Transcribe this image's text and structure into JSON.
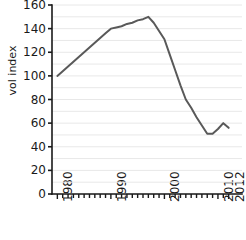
{
  "chart_data": {
    "type": "line",
    "title": "",
    "xlabel": "",
    "ylabel": "vol index",
    "xlim": [
      1979,
      2013
    ],
    "ylim": [
      0,
      160
    ],
    "grid": true,
    "grid_minor_step": 10,
    "legend": "none",
    "yticks": [
      0,
      20,
      40,
      60,
      80,
      100,
      120,
      140,
      160
    ],
    "ytick_labels": [
      "0",
      "20",
      "40",
      "60",
      "80",
      "100",
      "120",
      "140",
      "160"
    ],
    "xticks": [
      1980,
      1990,
      2000,
      2010,
      2012
    ],
    "xtick_labels": [
      "1980",
      "1990",
      "2000",
      "2010",
      "2012"
    ],
    "xtick_minor_step": 1,
    "series": [
      {
        "name": "vol index",
        "color": "#595959",
        "x": [
          1980,
          1981,
          1982,
          1983,
          1984,
          1985,
          1986,
          1987,
          1988,
          1989,
          1990,
          1991,
          1992,
          1993,
          1994,
          1995,
          1996,
          1997,
          1998,
          1999,
          2000,
          2001,
          2002,
          2003,
          2004,
          2005,
          2006,
          2007,
          2008,
          2009,
          2010,
          2011,
          2012
        ],
        "values": [
          100,
          104,
          108,
          112,
          116,
          120,
          124,
          128,
          132,
          136,
          140,
          141,
          142,
          144,
          145,
          147,
          148,
          150,
          145,
          138,
          131,
          118,
          105,
          92,
          80,
          73,
          65,
          58,
          51,
          51,
          55,
          60,
          56
        ]
      }
    ]
  },
  "axis": {
    "ylabel": "vol index"
  }
}
